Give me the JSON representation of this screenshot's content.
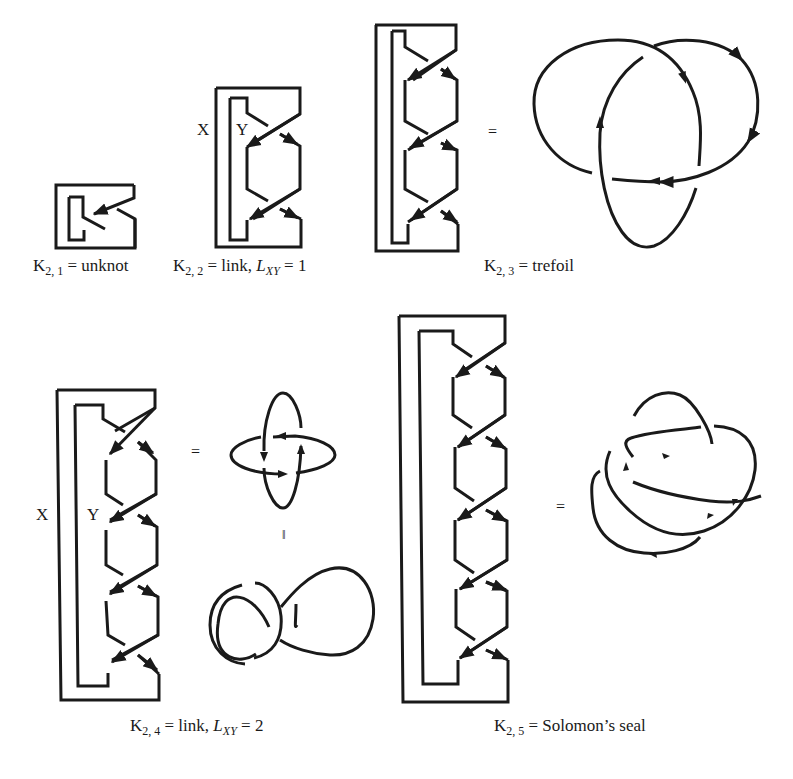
{
  "figure": {
    "panels": [
      {
        "id": "k21",
        "symbol": "K",
        "sub": "2, 1",
        "rest": " = unknot",
        "crossings": 1
      },
      {
        "id": "k22",
        "symbol": "K",
        "sub": "2, 2",
        "rest": " = link, ",
        "lk_symbol": "L",
        "lk_sub": "XY",
        "lk_value": " = 1",
        "crossings": 2,
        "strand_labels": [
          "X",
          "Y"
        ]
      },
      {
        "id": "k23",
        "symbol": "K",
        "sub": "2, 3",
        "rest": " = trefoil",
        "crossings": 3
      },
      {
        "id": "k24",
        "symbol": "K",
        "sub": "2, 4",
        "rest": " = link, ",
        "lk_symbol": "L",
        "lk_sub": "XY",
        "lk_value": " = 2",
        "crossings": 4,
        "strand_labels": [
          "X",
          "Y"
        ]
      },
      {
        "id": "k25",
        "symbol": "K",
        "sub": "2, 5",
        "rest": " = Solomon’s seal",
        "crossings": 5
      }
    ],
    "equals_sign": "=",
    "parallel_equals_sign": "‖",
    "stroke_color": "#1a1a1a",
    "background": "#ffffff"
  }
}
